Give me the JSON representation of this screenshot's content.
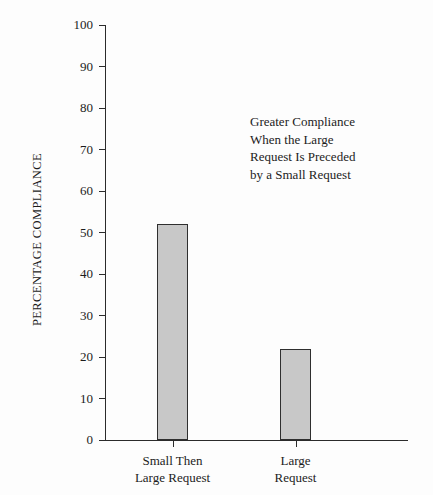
{
  "chart_data": {
    "type": "bar",
    "title": "",
    "categories": [
      "Small Then Large Request",
      "Large Request"
    ],
    "category_lines": [
      [
        "Small Then",
        "Large Request"
      ],
      [
        "Large",
        "Request"
      ]
    ],
    "values": [
      52,
      22
    ],
    "xlabel": "",
    "ylabel": "PERCENTAGE COMPLIANCE",
    "ylim": [
      0,
      100
    ],
    "yticks": [
      0,
      10,
      20,
      30,
      40,
      50,
      60,
      70,
      80,
      90,
      100
    ],
    "ytick_labels": [
      "0",
      "10",
      "20",
      "30",
      "40",
      "50",
      "60",
      "70",
      "80",
      "90",
      "100"
    ],
    "grid": false,
    "legend": "none",
    "annotations": [
      {
        "text": "Greater Compliance\nWhen the Large\nRequest Is Preceded\nby a Small Request",
        "lines": [
          "Greater Compliance",
          "When the Large",
          "Request Is Preceded",
          "by a Small Request"
        ]
      }
    ],
    "colors": {
      "bar_fill": "#c8c8c8",
      "bar_edge": "#2f2f2f",
      "axis": "#2b2b2b",
      "text": "#1c1c1c",
      "background": "#fdfdfd"
    }
  }
}
